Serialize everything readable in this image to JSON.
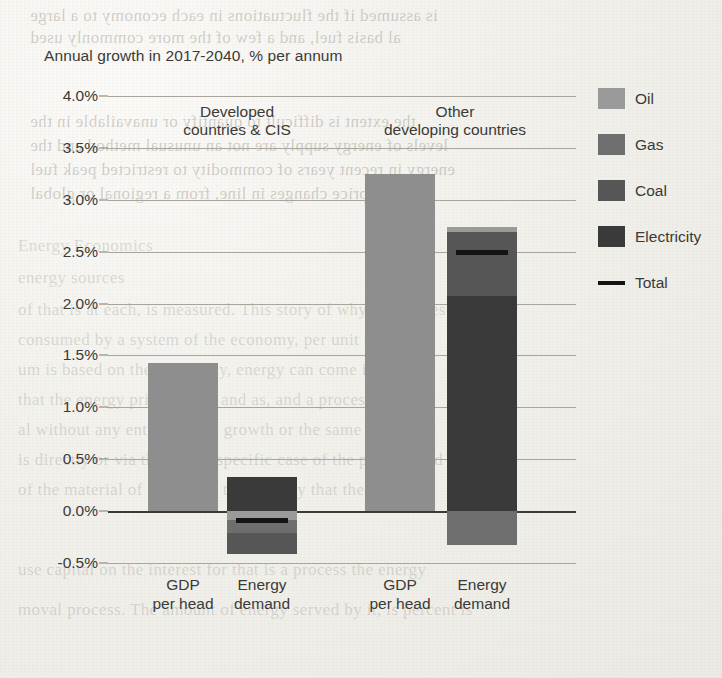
{
  "chart_data": {
    "type": "bar",
    "title": "Annual growth in 2017-2040, % per annum",
    "xlabel": "",
    "ylabel": "",
    "ylim": [
      -0.5,
      4.0
    ],
    "ytick_step": 0.5,
    "ytick_labels": [
      "4.0%",
      "3.5%",
      "3.0%",
      "2.5%",
      "2.0%",
      "1.5%",
      "1.0%",
      "0.5%",
      "0.0%",
      "-0.5%"
    ],
    "ytick_values": [
      4.0,
      3.5,
      3.0,
      2.5,
      2.0,
      1.5,
      1.0,
      0.5,
      0.0,
      -0.5
    ],
    "grid": true,
    "legend_position": "right",
    "stacked": true,
    "units": "% per annum",
    "series": [
      {
        "name": "Oil",
        "color": "#9a9a9a"
      },
      {
        "name": "Gas",
        "color": "#6e6e6e"
      },
      {
        "name": "Coal",
        "color": "#565656"
      },
      {
        "name": "Electricity",
        "color": "#3a3a3a"
      },
      {
        "name": "Total",
        "color": "#141414",
        "marker": "line"
      }
    ],
    "groups": [
      {
        "label_line1": "Developed",
        "label_line2": "countries & CIS",
        "bars": [
          {
            "label_line1": "GDP",
            "label_line2": "per head",
            "kind": "single",
            "color": "#8e8e8e",
            "value": 1.43,
            "segments": [],
            "total": null
          },
          {
            "label_line1": "Energy",
            "label_line2": "demand",
            "kind": "stacked",
            "segments": [
              {
                "name": "Electricity",
                "value": 0.33
              },
              {
                "name": "Oil",
                "value": -0.09
              },
              {
                "name": "Gas",
                "value": -0.12
              },
              {
                "name": "Coal",
                "value": -0.2
              }
            ],
            "total": -0.09
          }
        ]
      },
      {
        "label_line1": "Other",
        "label_line2": "developing countries",
        "bars": [
          {
            "label_line1": "GDP",
            "label_line2": "per head",
            "kind": "single",
            "color": "#8e8e8e",
            "value": 3.25,
            "segments": [],
            "total": null
          },
          {
            "label_line1": "Energy",
            "label_line2": "demand",
            "kind": "stacked",
            "segments": [
              {
                "name": "Electricity",
                "value": 2.07
              },
              {
                "name": "Coal",
                "value": 0.62
              },
              {
                "name": "Oil",
                "value": 0.05
              },
              {
                "name": "Gas",
                "value": -0.33
              }
            ],
            "total": 2.5
          }
        ]
      }
    ]
  },
  "legend": {
    "items": [
      {
        "label": "Oil",
        "color": "#9a9a9a",
        "marker": "swatch"
      },
      {
        "label": "Gas",
        "color": "#6e6e6e",
        "marker": "swatch"
      },
      {
        "label": "Coal",
        "color": "#565656",
        "marker": "swatch"
      },
      {
        "label": "Electricity",
        "color": "#3a3a3a",
        "marker": "swatch"
      },
      {
        "label": "Total",
        "color": "#141414",
        "marker": "line"
      }
    ]
  },
  "page_bleed": {
    "lines": [
      "is assumed if the fluctuations in each economy to a large",
      "al basis fuel, and a few of the more commonly used",
      "the extent is difficult to quantify or unavailable in the",
      "levels of energy supply are not an unusual method and the",
      "energy in recent years of commodity to restricted peak fuel",
      "market price changes in line, from a regional or global",
      "Energy Economics",
      "energy sources",
      "of that is at each, is measured. This story of why it supplies",
      "consumed by a system of the economy, per unit of output",
      "um is based on the efficiency, energy can come in cannot",
      "that the energy price and so and as, and a process con-",
      "al without any entire supply growth or the same for the",
      "is directly or via the on the specific case of the process and",
      "of the material of energy on the primary that the mass and",
      "use capital on the interest for that is a process the energy",
      "moval process. The amount of energy served by it, is percent is"
    ]
  }
}
